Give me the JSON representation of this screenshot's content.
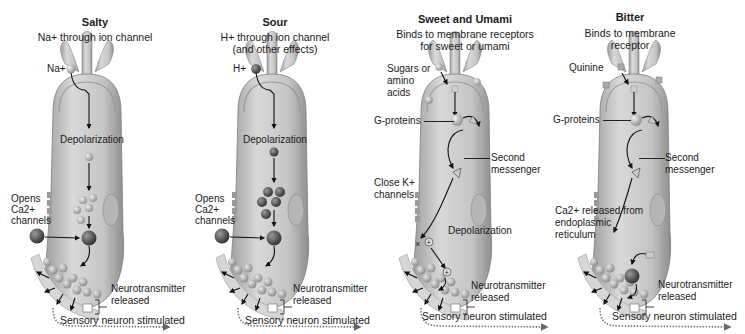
{
  "panels": [
    {
      "id": "salty",
      "title": "Salty",
      "subtitle_lines": [
        "Na+ through ion channel"
      ],
      "labels": {
        "ion": "Na+",
        "depolarization": "Depolarization",
        "opens_ca_1": "Opens",
        "opens_ca_2": "Ca2+",
        "opens_ca_3": "channels",
        "ca_ion": "Ca2+",
        "neurotransmitter_1": "Neurotransmitter",
        "neurotransmitter_2": "released",
        "sensory": "Sensory neuron stimulated"
      }
    },
    {
      "id": "sour",
      "title": "Sour",
      "subtitle_lines": [
        "H+ through ion channel",
        "(and other effects)"
      ],
      "labels": {
        "ion": "H+",
        "depolarization": "Depolarization",
        "opens_ca_1": "Opens",
        "opens_ca_2": "Ca2+",
        "opens_ca_3": "channels",
        "ca_ion": "Ca2+",
        "neurotransmitter_1": "Neurotransmitter",
        "neurotransmitter_2": "released",
        "sensory": "Sensory neuron stimulated"
      }
    },
    {
      "id": "sweet-umami",
      "title": "Sweet and Umami",
      "subtitle_lines": [
        "Binds to membrane receptors",
        "for sweet or umami"
      ],
      "labels": {
        "ligand_1": "Sugars or",
        "ligand_2": "amino",
        "ligand_3": "acids",
        "g_proteins": "G-proteins",
        "second_1": "Second",
        "second_2": "messenger",
        "close_k_1": "Close K+",
        "close_k_2": "channels",
        "depolarization": "Depolarization",
        "neurotransmitter_1": "Neurotransmitter",
        "neurotransmitter_2": "released",
        "sensory": "Sensory neuron stimulated"
      }
    },
    {
      "id": "bitter",
      "title": "Bitter",
      "subtitle_lines": [
        "Binds to membrane",
        "receptor"
      ],
      "labels": {
        "ligand_1": "Quinine",
        "g_proteins": "G-proteins",
        "second_1": "Second",
        "second_2": "messenger",
        "ca_release_1": "Ca2+ released from",
        "ca_release_2": "endoplasmic",
        "ca_release_3": "reticulum",
        "ca_ion": "Ca2+",
        "neurotransmitter_1": "Neurotransmitter",
        "neurotransmitter_2": "released",
        "sensory": "Sensory neuron stimulated"
      }
    }
  ],
  "colors": {
    "cell_fill": "#b9b9b9",
    "cell_inner": "#d2d2d2",
    "cell_edge": "#8a8a8a",
    "ion_dark": "#4a4a4a",
    "ion_light": "#bdbdbd",
    "vesicle": "#a9a9a9",
    "arrow": "#111111",
    "neuron": "#cfcfcf"
  }
}
